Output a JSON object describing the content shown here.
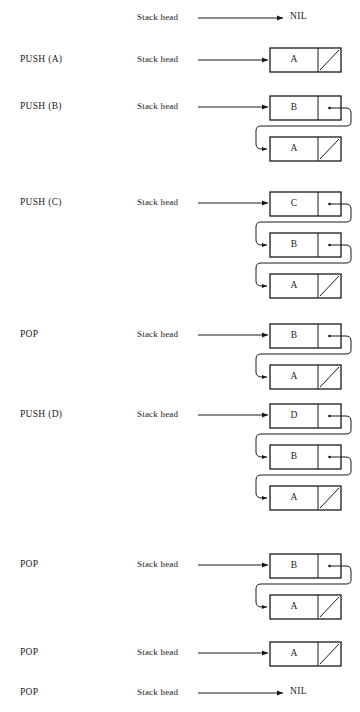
{
  "diagram": {
    "head_label": "Stack head",
    "nil_label": "NIL",
    "colors": {
      "ink": "#1a1a1a",
      "background": "#ffffff"
    },
    "node_geometry": {
      "box_left": 270,
      "box_right": 341,
      "divider_x": 318,
      "box_height": 24,
      "head_arrow_start_x": 198,
      "head_arrow_end_x": 268
    },
    "rows": [
      {
        "id": "row-initial",
        "op": "",
        "head_label": "Stack head",
        "head_y": 18,
        "terminator": "NIL",
        "nodes": []
      },
      {
        "id": "row-push-a",
        "op": "PUSH (A)",
        "op_y": 60,
        "head_label": "Stack head",
        "head_y": 60,
        "terminator": "node",
        "nodes": [
          {
            "value": "A",
            "y": 48,
            "next": "nil"
          }
        ]
      },
      {
        "id": "row-push-b",
        "op": "PUSH (B)",
        "op_y": 107,
        "head_label": "Stack head",
        "head_y": 107,
        "terminator": "node",
        "nodes": [
          {
            "value": "B",
            "y": 96,
            "next": "link"
          },
          {
            "value": "A",
            "y": 137,
            "next": "nil"
          }
        ]
      },
      {
        "id": "row-push-c",
        "op": "PUSH (C)",
        "op_y": 203,
        "head_label": "Stack head",
        "head_y": 203,
        "terminator": "node",
        "nodes": [
          {
            "value": "C",
            "y": 192,
            "next": "link"
          },
          {
            "value": "B",
            "y": 233,
            "next": "link"
          },
          {
            "value": "A",
            "y": 274,
            "next": "nil"
          }
        ]
      },
      {
        "id": "row-pop-1",
        "op": "POP",
        "op_y": 335,
        "head_label": "Stack head",
        "head_y": 335,
        "terminator": "node",
        "nodes": [
          {
            "value": "B",
            "y": 324,
            "next": "link"
          },
          {
            "value": "A",
            "y": 365,
            "next": "nil"
          }
        ]
      },
      {
        "id": "row-push-d",
        "op": "PUSH (D)",
        "op_y": 415,
        "head_label": "Stack head",
        "head_y": 415,
        "terminator": "node",
        "nodes": [
          {
            "value": "D",
            "y": 404,
            "next": "link"
          },
          {
            "value": "B",
            "y": 445,
            "next": "link"
          },
          {
            "value": "A",
            "y": 486,
            "next": "nil"
          }
        ]
      },
      {
        "id": "row-pop-2",
        "op": "POP",
        "op_y": 565,
        "head_label": "Stack head",
        "head_y": 565,
        "terminator": "node",
        "nodes": [
          {
            "value": "B",
            "y": 554,
            "next": "link"
          },
          {
            "value": "A",
            "y": 595,
            "next": "nil"
          }
        ]
      },
      {
        "id": "row-pop-3",
        "op": "POP",
        "op_y": 653,
        "head_label": "Stack head",
        "head_y": 653,
        "terminator": "node",
        "nodes": [
          {
            "value": "A",
            "y": 642,
            "next": "nil"
          }
        ]
      },
      {
        "id": "row-pop-4",
        "op": "POP",
        "op_y": 693,
        "head_label": "Stack head",
        "head_y": 693,
        "terminator": "NIL",
        "nodes": []
      }
    ]
  }
}
